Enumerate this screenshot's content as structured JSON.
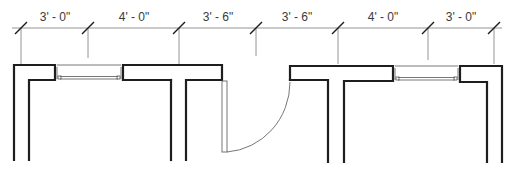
{
  "drawing": {
    "type": "floor-plan",
    "dimensions": [
      {
        "label": "3' - 0\""
      },
      {
        "label": "4' - 0\""
      },
      {
        "label": "3' - 6\""
      },
      {
        "label": "3' - 6\""
      },
      {
        "label": "4' - 0\""
      },
      {
        "label": "3' - 0\""
      }
    ],
    "elements": {
      "windows": 2,
      "doors": 1,
      "door_swing": "left-hinged, opens inward"
    },
    "colors": {
      "wall": "#1e1e1e",
      "dimension_line": "#7a7a7a",
      "text": "#3a3a3a"
    }
  }
}
